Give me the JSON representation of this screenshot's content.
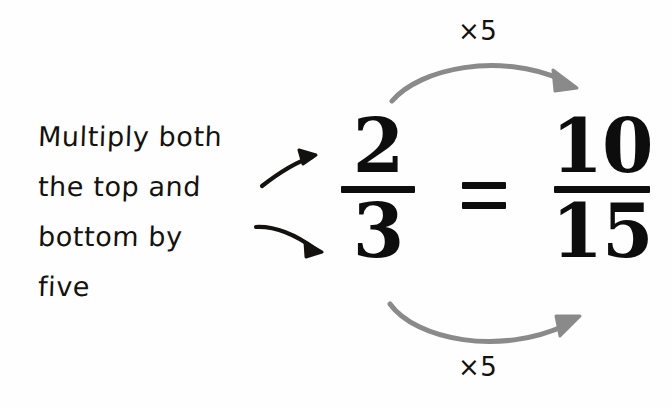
{
  "canvas": {
    "width": 672,
    "height": 408,
    "background_color": "#fefefe"
  },
  "palette": {
    "ink_black": "#14120f",
    "print_black": "#0d0d0d",
    "arc_gray": "#8a8a8a"
  },
  "instruction": {
    "full_text": "Multiply both the top and bottom by five",
    "lines": [
      {
        "text": "Multiply both"
      },
      {
        "text": "the top and"
      },
      {
        "text": "bottom by"
      },
      {
        "text": "five"
      }
    ]
  },
  "equation": {
    "left_fraction": {
      "numerator": "2",
      "denominator": "3"
    },
    "relation": "=",
    "right_fraction": {
      "numerator": "10",
      "denominator": "15"
    }
  },
  "multipliers": {
    "top_label": "×5",
    "bottom_label": "×5"
  },
  "arrows": {
    "pointer_to_numerator": "curved-arrow-up-right",
    "pointer_to_denominator": "curved-arrow-down-right",
    "numerator_arc": "curved-arc-over-right",
    "denominator_arc": "curved-arc-under-right"
  }
}
